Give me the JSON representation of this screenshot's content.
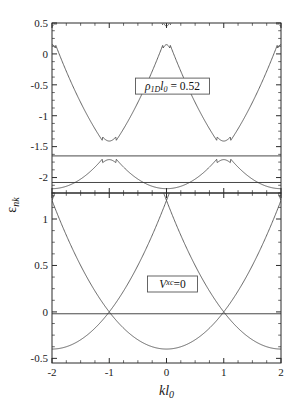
{
  "figure": {
    "title": "",
    "background": "#ffffff",
    "line_color": "#4a4a4a",
    "axis_color": "#2b2b2b",
    "fermi_color": "#333333",
    "width": 300,
    "height": 410
  },
  "axes": {
    "x_label": "kl",
    "x_label_sub": "0",
    "y_label": "ε",
    "y_label_sub": "nk",
    "x_ticks": [
      "-2",
      "-1",
      "0",
      "1",
      "2"
    ],
    "x_tick_values": [
      -2,
      -1,
      0,
      1,
      2
    ],
    "x_minor_step": 0.25,
    "xlim": [
      -2,
      2
    ]
  },
  "panels": [
    {
      "name": "top",
      "annotation": {
        "text_parts": [
          "ρ",
          "1D",
          "l",
          "0",
          " = 0.52"
        ],
        "plain": "ρ1Dl0 = 0.52",
        "boxed": true
      },
      "y_ticks": [
        "0.5",
        "0",
        "-0.5",
        "-1",
        "-1.5",
        "-2"
      ],
      "y_tick_values": [
        0.5,
        0,
        -0.5,
        -1,
        -1.5,
        -2
      ],
      "y_minor_step": 0.125,
      "ylim": [
        -2.25,
        0.5
      ],
      "fermi_levels": [
        -1.65,
        -2.08
      ]
    },
    {
      "name": "bottom",
      "annotation": {
        "text_parts": [
          "V",
          "xc",
          "=0"
        ],
        "plain": "Vxc=0",
        "boxed": true
      },
      "y_ticks": [
        "1",
        "0.5",
        "0",
        "-0.5"
      ],
      "y_tick_values": [
        1,
        0.5,
        0,
        -0.5
      ],
      "y_minor_step": 0.125,
      "ylim": [
        -0.55,
        1.28
      ],
      "fermi_levels": [
        -0.02
      ]
    }
  ],
  "chart_data": {
    "type": "line",
    "title": "",
    "xlabel": "kl_0",
    "ylabel": "ε_nk",
    "xlim": [
      -2,
      2
    ],
    "grid": false,
    "legend": "none",
    "panels": [
      {
        "name": "top",
        "label": "ρ_1D l_0 = 0.52",
        "ylim": [
          -2.25,
          0.5
        ],
        "model": "gapped",
        "band_offset": -2.18,
        "curvature": 0.62,
        "gap": 0.3,
        "zone_period": 2.0,
        "fermi_levels": [
          -1.65,
          -2.08
        ],
        "series": [
          {
            "name": "band-1",
            "x": [
              -2,
              -1.75,
              -1.5,
              -1.25,
              -1,
              -0.75,
              -0.5,
              -0.25,
              0,
              0.25,
              0.5,
              0.75,
              1,
              1.25,
              1.5,
              1.75,
              2
            ],
            "y": [
              -1.41,
              -1.6,
              -1.78,
              -1.91,
              -1.97,
              -1.95,
              -1.87,
              -1.73,
              -1.55,
              -1.73,
              -1.87,
              -1.95,
              -1.97,
              -1.91,
              -1.78,
              -1.6,
              -1.41
            ]
          },
          {
            "name": "band-2",
            "x": [
              -2,
              -1.75,
              -1.5,
              -1.25,
              -1,
              -0.75,
              -0.5,
              -0.25,
              0,
              0.25,
              0.5,
              0.75,
              1,
              1.25,
              1.5,
              1.75,
              2
            ],
            "y": [
              0.13,
              -0.17,
              -0.48,
              -0.79,
              -1.05,
              -1.26,
              -1.4,
              -1.49,
              -1.52,
              -1.49,
              -1.4,
              -1.26,
              -1.05,
              -0.79,
              -0.48,
              -0.17,
              0.13
            ]
          },
          {
            "name": "band-3",
            "x": [
              -2,
              -1.75,
              -1.5,
              -1.25,
              -1,
              -0.75,
              -0.5,
              -0.25,
              0,
              0.25,
              0.5,
              0.75,
              1,
              1.25,
              1.5,
              1.75,
              2
            ],
            "y": [
              0.5,
              0.36,
              0.05,
              -0.14,
              -0.19,
              -0.16,
              -0.07,
              0.04,
              0.09,
              0.04,
              -0.07,
              -0.16,
              -0.19,
              -0.14,
              0.05,
              0.36,
              0.5
            ]
          },
          {
            "name": "band-4",
            "x": [
              -1.5,
              -1.25,
              -1,
              -0.75,
              -0.5,
              -0.25,
              0,
              0.25,
              0.5,
              0.75,
              1,
              1.25,
              1.5
            ],
            "y": [
              0.5,
              0.3,
              0.17,
              0.22,
              0.35,
              0.47,
              0.5,
              0.47,
              0.35,
              0.22,
              0.17,
              0.3,
              0.5
            ]
          }
        ]
      },
      {
        "name": "bottom",
        "label": "V^xc = 0",
        "ylim": [
          -0.55,
          1.28
        ],
        "model": "free",
        "band_offset": -0.4,
        "curvature": 0.4,
        "gap": 0.0,
        "zone_period": 2.0,
        "fermi_levels": [
          -0.02
        ],
        "series": [
          {
            "name": "band-1",
            "x": [
              -2,
              -1.5,
              -1,
              -0.5,
              0,
              0.5,
              1,
              1.5,
              2
            ],
            "y": [
              0.22,
              -0.22,
              -0.4,
              -0.22,
              0.22,
              -0.22,
              -0.4,
              -0.22,
              0.22
            ]
          },
          {
            "name": "band-2",
            "x": [
              -2,
              -1.5,
              -1,
              -0.5,
              0,
              0.5,
              1,
              1.5,
              2
            ],
            "y": [
              1.28,
              0.78,
              0.5,
              0.78,
              0.5,
              0.78,
              0.5,
              0.78,
              1.28
            ]
          }
        ]
      }
    ]
  }
}
